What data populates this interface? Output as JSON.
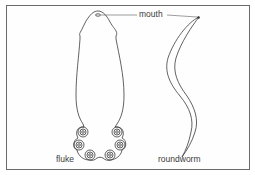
{
  "figure": {
    "labels": {
      "mouth": "mouth",
      "fluke": "fluke",
      "roundworm": "roundworm"
    },
    "organisms": [
      {
        "name": "fluke",
        "features": [
          "mouth",
          "6 posterior suckers"
        ]
      },
      {
        "name": "roundworm",
        "features": [
          "mouth"
        ]
      }
    ],
    "colors": {
      "line": "#3a3a3a",
      "border": "#6a6a6a",
      "background": "#ffffff"
    }
  }
}
